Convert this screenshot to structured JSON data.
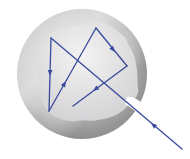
{
  "diagram": {
    "title": "Light ray entering a cavity through an aperture and reflecting repeatedly off the rough inner wall",
    "colors": {
      "background": "#ffffff",
      "shell_outer": "#9e9e9e",
      "shell_mid": "#c4c4c4",
      "shell_highlight": "#e6e6e6",
      "cavity_interior": "#e9e9ea",
      "cavity_shadow": "#d2d2d4",
      "ray": "#3a4a9c"
    },
    "ray_path": [
      {
        "id": "incoming",
        "label": "incoming ray",
        "direction": "up-left"
      },
      {
        "id": "reflection-1",
        "label": "first reflection",
        "direction": "down"
      },
      {
        "id": "reflection-2",
        "label": "second reflection",
        "direction": "up-right"
      },
      {
        "id": "reflection-3",
        "label": "third reflection",
        "direction": "down-right"
      },
      {
        "id": "reflection-4",
        "label": "fourth reflection",
        "direction": "down-left"
      }
    ],
    "parts": {
      "shell": "spherical shell",
      "cavity": "hollow interior with irregular walls",
      "aperture": "small opening in shell"
    }
  }
}
